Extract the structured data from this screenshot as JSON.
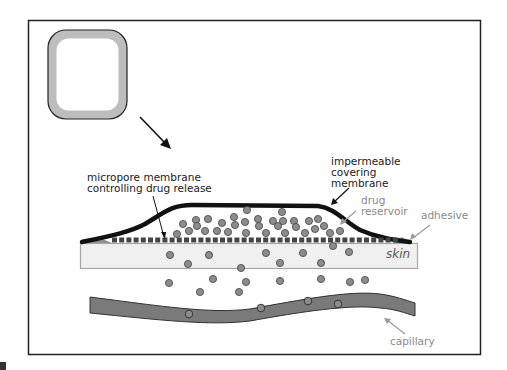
{
  "diagram": {
    "labels": {
      "micropore_line1": "micropore membrane",
      "micropore_line2": "controlling drug release",
      "impermeable_line1": "impermeable",
      "impermeable_line2": "covering",
      "impermeable_line3": "membrane",
      "drug_reservoir_line1": "drug",
      "drug_reservoir_line2": "reservoir",
      "adhesive": "adhesive",
      "skin": "skin",
      "capillary": "capillary"
    },
    "colors": {
      "frame": "#222222",
      "patch_ring": "#bdbdbd",
      "membrane": "#111111",
      "micropore": "#444444",
      "drug_dot": "#8c8c8c",
      "skin_fill": "#f0f0f0",
      "skin_border": "#a8a8a8",
      "capillary_fill": "#7a7a7a",
      "adhesive": "#9a9a9a"
    }
  }
}
